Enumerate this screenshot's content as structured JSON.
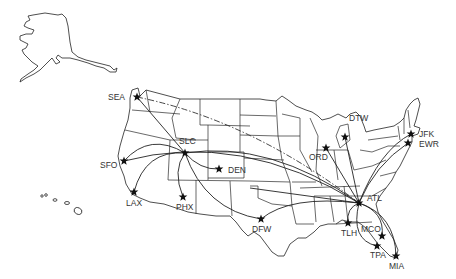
{
  "map": {
    "title": "US airline route map",
    "colors": {
      "background": "#ffffff",
      "lines": "#222222",
      "labels": "#333333",
      "markers": "#111111"
    },
    "airports": [
      {
        "code": "SEA",
        "x": 137,
        "y": 97,
        "lx": 108,
        "ly": 100
      },
      {
        "code": "SLC",
        "x": 185,
        "y": 153,
        "lx": 179,
        "ly": 144
      },
      {
        "code": "SFO",
        "x": 124,
        "y": 161,
        "lx": 100,
        "ly": 168
      },
      {
        "code": "DEN",
        "x": 219,
        "y": 169,
        "lx": 228,
        "ly": 173
      },
      {
        "code": "LAX",
        "x": 134,
        "y": 192,
        "lx": 126,
        "ly": 206
      },
      {
        "code": "PHX",
        "x": 183,
        "y": 197,
        "lx": 176,
        "ly": 210
      },
      {
        "code": "DFW",
        "x": 261,
        "y": 219,
        "lx": 252,
        "ly": 232
      },
      {
        "code": "ORD",
        "x": 326,
        "y": 148,
        "lx": 309,
        "ly": 160
      },
      {
        "code": "DTW",
        "x": 345,
        "y": 137,
        "lx": 349,
        "ly": 121
      },
      {
        "code": "JFK",
        "x": 411,
        "y": 134,
        "lx": 419,
        "ly": 137
      },
      {
        "code": "EWR",
        "x": 408,
        "y": 143,
        "lx": 419,
        "ly": 147
      },
      {
        "code": "ATL",
        "x": 359,
        "y": 203,
        "lx": 367,
        "ly": 201
      },
      {
        "code": "TLH",
        "x": 348,
        "y": 223,
        "lx": 341,
        "ly": 236
      },
      {
        "code": "MCO",
        "x": 382,
        "y": 236,
        "lx": 361,
        "ly": 232
      },
      {
        "code": "TPA",
        "x": 377,
        "y": 246,
        "lx": 370,
        "ly": 258
      },
      {
        "code": "MIA",
        "x": 396,
        "y": 256,
        "lx": 389,
        "ly": 269
      }
    ],
    "routes": [
      {
        "from": "SEA",
        "to": "SLC",
        "style": "solid"
      },
      {
        "from": "SEA",
        "to": "ATL",
        "style": "dash-dot"
      },
      {
        "from": "SFO",
        "to": "SLC",
        "style": "solid"
      },
      {
        "from": "LAX",
        "to": "SLC",
        "style": "solid"
      },
      {
        "from": "PHX",
        "to": "SLC",
        "style": "solid"
      },
      {
        "from": "DEN",
        "to": "SLC",
        "style": "solid"
      },
      {
        "from": "SLC",
        "to": "DFW",
        "style": "solid"
      },
      {
        "from": "SLC",
        "to": "ATL",
        "style": "solid"
      },
      {
        "from": "SFO",
        "to": "ATL",
        "style": "solid"
      },
      {
        "from": "DFW",
        "to": "ATL",
        "style": "solid"
      },
      {
        "from": "ORD",
        "to": "ATL",
        "style": "solid"
      },
      {
        "from": "DTW",
        "to": "ATL",
        "style": "solid"
      },
      {
        "from": "JFK",
        "to": "ATL",
        "style": "solid"
      },
      {
        "from": "EWR",
        "to": "ATL",
        "style": "solid"
      },
      {
        "from": "TLH",
        "to": "ATL",
        "style": "solid"
      },
      {
        "from": "MCO",
        "to": "ATL",
        "style": "solid"
      },
      {
        "from": "TPA",
        "to": "ATL",
        "style": "solid"
      },
      {
        "from": "MIA",
        "to": "ATL",
        "style": "solid"
      }
    ]
  }
}
